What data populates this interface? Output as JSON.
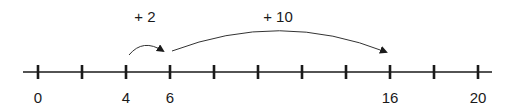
{
  "number_line": {
    "min": 0,
    "max": 20,
    "step": 2,
    "ticks": [
      0,
      2,
      4,
      6,
      8,
      10,
      12,
      14,
      16,
      18,
      20
    ],
    "labeled_ticks": [
      {
        "value": 0,
        "label": "0"
      },
      {
        "value": 4,
        "label": "4"
      },
      {
        "value": 6,
        "label": "6"
      },
      {
        "value": 16,
        "label": "16"
      },
      {
        "value": 20,
        "label": "20"
      }
    ]
  },
  "jumps": [
    {
      "from": 4,
      "to": 6,
      "label": "+ 2"
    },
    {
      "from": 6,
      "to": 16,
      "label": "+ 10"
    }
  ],
  "colors": {
    "line": "#1a1a1a",
    "arc": "#333333",
    "text": "#1a1a1a"
  }
}
